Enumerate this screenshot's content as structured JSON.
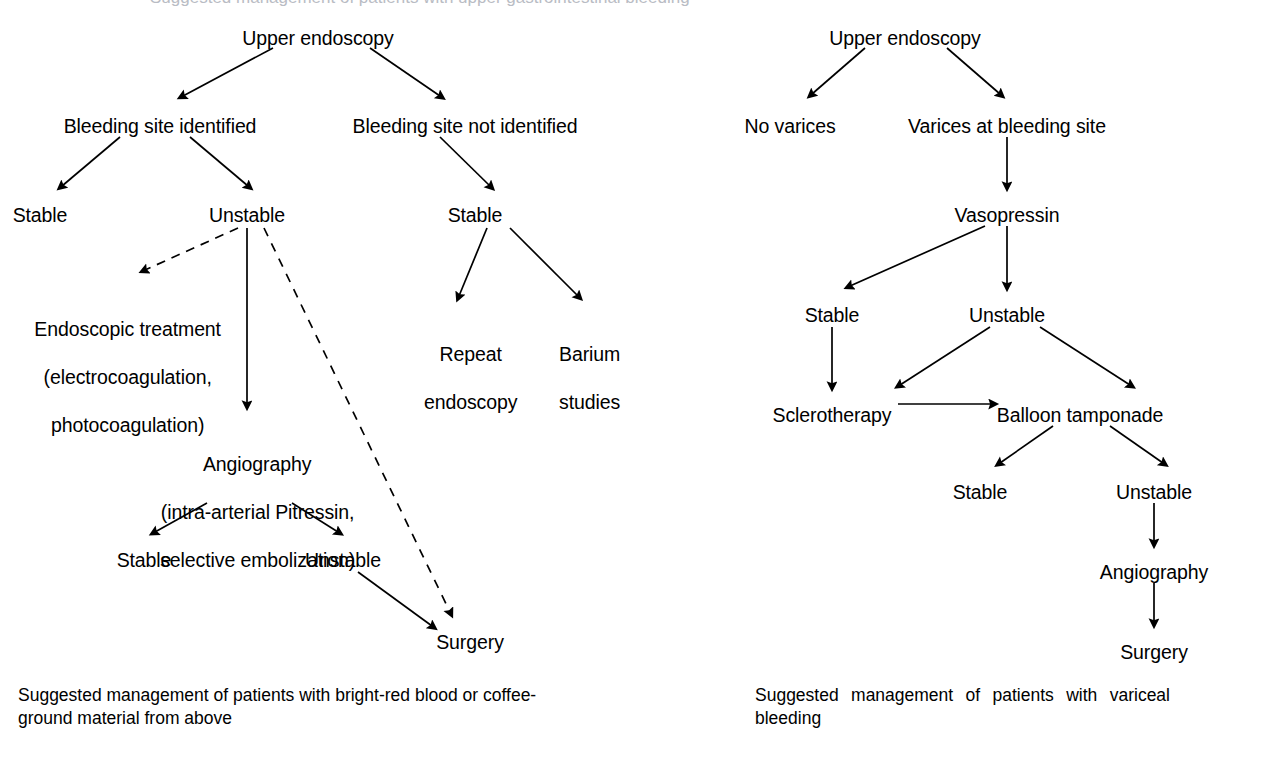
{
  "page": {
    "background_color": "#ffffff",
    "ink_color": "#000000",
    "top_clipped_text": "Suggested management of patients with upper gastrointestinal bleeding"
  },
  "figures": [
    {
      "id": "left-figure",
      "caption_lines": [
        "Suggested management of patients with bright-red blood or coffee-",
        "ground material from above"
      ],
      "nodes": [
        {
          "id": "l-upper-endoscopy",
          "label": "Upper endoscopy",
          "x": 318,
          "y": 26,
          "lines": [
            "Upper endoscopy"
          ]
        },
        {
          "id": "l-site-identified",
          "label": "Bleeding site identified",
          "x": 160,
          "y": 114,
          "lines": [
            "Bleeding site identified"
          ]
        },
        {
          "id": "l-site-not-identified",
          "label": "Bleeding site not identified",
          "x": 465,
          "y": 114,
          "lines": [
            "Bleeding site not identified"
          ]
        },
        {
          "id": "l-stable-1",
          "label": "Stable",
          "x": 40,
          "y": 203,
          "lines": [
            "Stable"
          ]
        },
        {
          "id": "l-unstable-1",
          "label": "Unstable",
          "x": 247,
          "y": 203,
          "lines": [
            "Unstable"
          ]
        },
        {
          "id": "l-stable-2",
          "label": "Stable",
          "x": 475,
          "y": 203,
          "lines": [
            "Stable"
          ]
        },
        {
          "id": "l-endoscopic-treatment",
          "label": "Endoscopic treatment (electrocoagulation, photocoagulation)",
          "x": 117,
          "y": 293,
          "lines": [
            "Endoscopic treatment",
            "(electrocoagulation,",
            "photocoagulation)"
          ]
        },
        {
          "id": "l-repeat-endoscopy",
          "label": "Repeat endoscopy",
          "x": 460,
          "y": 318,
          "lines": [
            "Repeat",
            "endoscopy"
          ]
        },
        {
          "id": "l-barium-studies",
          "label": "Barium studies",
          "x": 579,
          "y": 318,
          "lines": [
            "Barium",
            "studies"
          ]
        },
        {
          "id": "l-angiography",
          "label": "Angiography (intra-arterial Pitressin, selective embolization)",
          "x": 247,
          "y": 428,
          "lines": [
            "Angiography",
            "(intra-arterial Pitressin,",
            "selective embolization)"
          ]
        },
        {
          "id": "l-stable-3",
          "label": "Stable",
          "x": 144,
          "y": 548,
          "lines": [
            "Stable"
          ]
        },
        {
          "id": "l-unstable-2",
          "label": "Unstable",
          "x": 343,
          "y": 548,
          "lines": [
            "Unstable"
          ]
        },
        {
          "id": "l-surgery",
          "label": "Surgery",
          "x": 470,
          "y": 630,
          "lines": [
            "Surgery"
          ]
        }
      ],
      "edges": [
        {
          "from": "l-upper-endoscopy",
          "to": "l-site-identified",
          "style": "solid",
          "arrow": true
        },
        {
          "from": "l-upper-endoscopy",
          "to": "l-site-not-identified",
          "style": "solid",
          "arrow": true
        },
        {
          "from": "l-site-identified",
          "to": "l-stable-1",
          "style": "solid",
          "arrow": true
        },
        {
          "from": "l-site-identified",
          "to": "l-unstable-1",
          "style": "solid",
          "arrow": true
        },
        {
          "from": "l-site-not-identified",
          "to": "l-stable-2",
          "style": "solid",
          "arrow": true
        },
        {
          "from": "l-unstable-1",
          "to": "l-endoscopic-treatment",
          "style": "dashed",
          "arrow": true
        },
        {
          "from": "l-unstable-1",
          "to": "l-angiography",
          "style": "solid",
          "arrow": true
        },
        {
          "from": "l-unstable-1",
          "to": "l-surgery",
          "style": "dashed",
          "arrow": true
        },
        {
          "from": "l-stable-2",
          "to": "l-repeat-endoscopy",
          "style": "solid",
          "arrow": true
        },
        {
          "from": "l-stable-2",
          "to": "l-barium-studies",
          "style": "solid",
          "arrow": true
        },
        {
          "from": "l-angiography",
          "to": "l-stable-3",
          "style": "solid",
          "arrow": true
        },
        {
          "from": "l-angiography",
          "to": "l-unstable-2",
          "style": "solid",
          "arrow": true
        },
        {
          "from": "l-unstable-2",
          "to": "l-surgery",
          "style": "solid",
          "arrow": true
        }
      ]
    },
    {
      "id": "right-figure",
      "caption_lines": [
        "Suggested management of patients with variceal",
        "bleeding"
      ],
      "nodes": [
        {
          "id": "r-upper-endoscopy",
          "label": "Upper endoscopy",
          "x": 905,
          "y": 26,
          "lines": [
            "Upper endoscopy"
          ]
        },
        {
          "id": "r-no-varices",
          "label": "No varices",
          "x": 790,
          "y": 114,
          "lines": [
            "No varices"
          ]
        },
        {
          "id": "r-varices-at-site",
          "label": "Varices at bleeding site",
          "x": 1007,
          "y": 114,
          "lines": [
            "Varices at bleeding site"
          ]
        },
        {
          "id": "r-vasopressin",
          "label": "Vasopressin",
          "x": 1007,
          "y": 203,
          "lines": [
            "Vasopressin"
          ]
        },
        {
          "id": "r-stable-1",
          "label": "Stable",
          "x": 832,
          "y": 303,
          "lines": [
            "Stable"
          ]
        },
        {
          "id": "r-unstable-1",
          "label": "Unstable",
          "x": 1007,
          "y": 303,
          "lines": [
            "Unstable"
          ]
        },
        {
          "id": "r-sclerotherapy",
          "label": "Sclerotherapy",
          "x": 832,
          "y": 403,
          "lines": [
            "Sclerotherapy"
          ]
        },
        {
          "id": "r-balloon-tamponade",
          "label": "Balloon tamponade",
          "x": 1080,
          "y": 403,
          "lines": [
            "Balloon tamponade"
          ]
        },
        {
          "id": "r-stable-2",
          "label": "Stable",
          "x": 980,
          "y": 480,
          "lines": [
            "Stable"
          ]
        },
        {
          "id": "r-unstable-2",
          "label": "Unstable",
          "x": 1154,
          "y": 480,
          "lines": [
            "Unstable"
          ]
        },
        {
          "id": "r-angiography",
          "label": "Angiography",
          "x": 1154,
          "y": 560,
          "lines": [
            "Angiography"
          ]
        },
        {
          "id": "r-surgery",
          "label": "Surgery",
          "x": 1154,
          "y": 640,
          "lines": [
            "Surgery"
          ]
        }
      ],
      "edges": [
        {
          "from": "r-upper-endoscopy",
          "to": "r-no-varices",
          "style": "solid",
          "arrow": true
        },
        {
          "from": "r-upper-endoscopy",
          "to": "r-varices-at-site",
          "style": "solid",
          "arrow": true
        },
        {
          "from": "r-varices-at-site",
          "to": "r-vasopressin",
          "style": "solid",
          "arrow": true
        },
        {
          "from": "r-vasopressin",
          "to": "r-stable-1",
          "style": "solid",
          "arrow": true
        },
        {
          "from": "r-vasopressin",
          "to": "r-unstable-1",
          "style": "solid",
          "arrow": true
        },
        {
          "from": "r-stable-1",
          "to": "r-sclerotherapy",
          "style": "solid",
          "arrow": true
        },
        {
          "from": "r-unstable-1",
          "to": "r-sclerotherapy",
          "style": "solid",
          "arrow": true
        },
        {
          "from": "r-unstable-1",
          "to": "r-balloon-tamponade",
          "style": "solid",
          "arrow": true
        },
        {
          "from": "r-sclerotherapy",
          "to": "r-balloon-tamponade",
          "style": "solid",
          "arrow": true
        },
        {
          "from": "r-balloon-tamponade",
          "to": "r-stable-2",
          "style": "solid",
          "arrow": true
        },
        {
          "from": "r-balloon-tamponade",
          "to": "r-unstable-2",
          "style": "solid",
          "arrow": true
        },
        {
          "from": "r-unstable-2",
          "to": "r-angiography",
          "style": "solid",
          "arrow": true
        },
        {
          "from": "r-angiography",
          "to": "r-surgery",
          "style": "solid",
          "arrow": true
        }
      ]
    }
  ]
}
